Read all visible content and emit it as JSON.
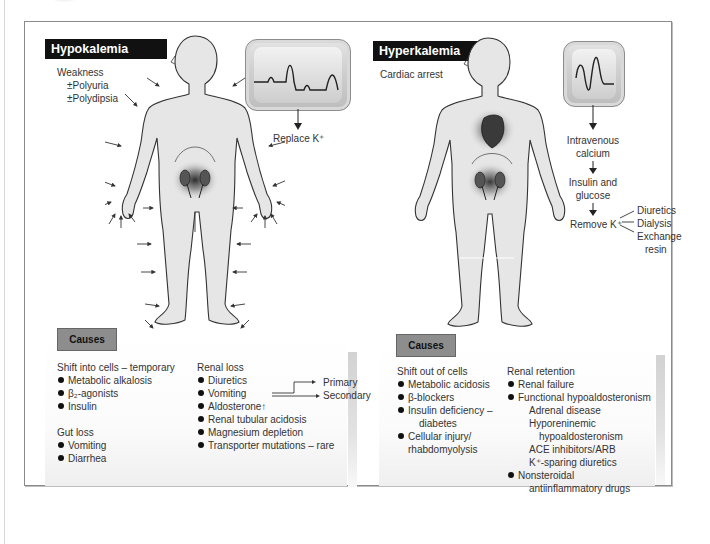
{
  "panels": {
    "hypokalemia": {
      "title": "Hypokalemia",
      "symptoms": [
        "Weakness",
        "±Polyuria",
        "±Polydipsia"
      ],
      "ecg_label": "Replace K⁺",
      "causes_label": "Causes",
      "groups": {
        "shift": {
          "heading": "Shift into cells – temporary",
          "items": [
            "Metabolic alkalosis",
            "β₂-agonists",
            "Insulin"
          ]
        },
        "gut": {
          "heading": "Gut loss",
          "items": [
            "Vomiting",
            "Diarrhea"
          ]
        },
        "renal": {
          "heading": "Renal loss",
          "items": [
            "Diuretics",
            "Vomiting",
            "Aldosterone↑",
            "Renal tubular acidosis",
            "Magnesium depletion",
            "Transporter mutations – rare"
          ],
          "aldosterone_branches": [
            "Primary",
            "Secondary"
          ]
        }
      }
    },
    "hyperkalemia": {
      "title": "Hyperkalemia",
      "symptoms": [
        "Cardiac arrest"
      ],
      "treatment_steps": [
        "Intravenous",
        "calcium",
        "Insulin and",
        "glucose",
        "Remove K⁺"
      ],
      "remove_options": [
        "Diuretics",
        "Dialysis",
        "Exchange",
        "resin"
      ],
      "causes_label": "Causes",
      "groups": {
        "shift": {
          "heading": "Shift out of cells",
          "items": [
            "Metabolic acidosis",
            "β-blockers",
            "Insulin deficiency –",
            "diabetes",
            "Cellular injury/",
            "rhabdomyolysis"
          ]
        },
        "renal": {
          "heading": "Renal retention",
          "items": [
            "Renal failure",
            "Functional hypoaldosteronism",
            "Adrenal disease",
            "Hyporeninemic",
            "hypoaldosteronism",
            "ACE inhibitors/ARB",
            "K⁺-sparing diuretics",
            "Nonsteroidal",
            "antiinflammatory drugs"
          ]
        }
      }
    }
  },
  "colors": {
    "title_bar": "#111111",
    "causes_tag": "#8d8d8d",
    "frame_border": "#8a8a8a",
    "body_fill": "#e6e6e6",
    "text": "#333333"
  }
}
